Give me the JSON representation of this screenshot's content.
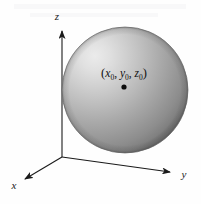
{
  "figure": {
    "background_color": "#fefefe",
    "axes": {
      "origin": {
        "x": 62,
        "y": 157
      },
      "x_axis": {
        "label": "x",
        "label_x": 14,
        "label_y": 188,
        "tip_x": 23,
        "tip_y": 181,
        "color": "#1a1a1a"
      },
      "y_axis": {
        "label": "y",
        "label_x": 183,
        "label_y": 178,
        "tip_x": 174,
        "tip_y": 173,
        "color": "#1a1a1a"
      },
      "z_axis": {
        "label": "z",
        "label_x": 57,
        "label_y": 20,
        "tip_x": 62,
        "tip_y": 29,
        "color": "#1a1a1a"
      }
    },
    "sphere": {
      "center_x": 125,
      "center_y": 90,
      "radius": 63,
      "fill_light": "#e9e9e9",
      "fill_mid": "#a8a8a8",
      "fill_dark": "#6d6d6d",
      "edge_color": "#5a5a5a",
      "highlight_x": 95,
      "highlight_y": 55
    },
    "center_point": {
      "label_parts": {
        "open_paren": "(",
        "x_var": "x",
        "x_sub": "0",
        "comma1": ", ",
        "y_var": "y",
        "y_sub": "0",
        "comma2": ", ",
        "z_var": "z",
        "z_sub": "0",
        "close_paren": ")"
      },
      "label_text": "(x0, y0, z0)",
      "label_x": 124,
      "label_y": 76,
      "dot_x": 124,
      "dot_y": 87,
      "dot_radius": 2.6,
      "dot_color": "#0d0d0d"
    }
  }
}
